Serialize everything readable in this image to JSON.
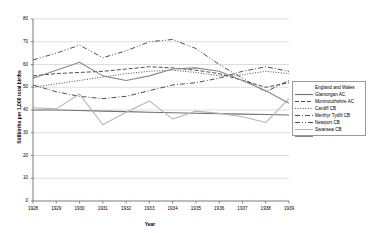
{
  "chart_data": {
    "type": "line",
    "title": "",
    "xlabel": "Year",
    "ylabel": "Stillbirths per 1,000 total births",
    "categories": [
      "1928",
      "1929",
      "1930",
      "1931",
      "1932",
      "1933",
      "1934",
      "1935",
      "1936",
      "1937",
      "1938",
      "1939"
    ],
    "x": [
      1928,
      1929,
      1930,
      1931,
      1932,
      1933,
      1934,
      1935,
      1936,
      1937,
      1938,
      1939
    ],
    "xlim": [
      1928,
      1939
    ],
    "ylim": [
      0,
      80
    ],
    "yticks": [
      0,
      10,
      20,
      30,
      40,
      50,
      60,
      70,
      80
    ],
    "grid": true,
    "legend_position": "right",
    "series": [
      {
        "name": "England and Wales",
        "dash": "solid",
        "color": "#6f6f6f",
        "width": 1.1,
        "values": [
          40,
          40,
          39.8,
          39.5,
          39.3,
          39,
          38.8,
          38.6,
          38.4,
          38.2,
          38,
          37.8
        ]
      },
      {
        "name": "Glamorgan AC",
        "dash": "dashed",
        "color": "#3a3a3a",
        "width": 0.9,
        "values": [
          55,
          56,
          56.5,
          57,
          58,
          59,
          58.5,
          57.5,
          56,
          53,
          50,
          52
        ]
      },
      {
        "name": "Monmouthshire AC",
        "dash": "dotted",
        "color": "#3a3a3a",
        "width": 0.9,
        "values": [
          50,
          51.5,
          53,
          54.5,
          56,
          57,
          57.5,
          56.5,
          55,
          55.5,
          57,
          56
        ]
      },
      {
        "name": "Cardiff CB",
        "dash": "dashdot",
        "color": "#3a3a3a",
        "width": 0.9,
        "values": [
          51,
          48,
          46,
          45,
          46,
          48.5,
          51,
          52,
          54,
          57,
          59,
          57
        ]
      },
      {
        "name": "Merthyr Tydfil CB",
        "dash": "dashdotdot",
        "color": "#3a3a3a",
        "width": 0.9,
        "values": [
          62,
          65,
          68.5,
          63,
          66,
          70,
          71,
          67,
          60,
          54,
          48,
          53
        ]
      },
      {
        "name": "Newport CB",
        "dash": "solid",
        "color": "#b6b6b6",
        "width": 1.1,
        "values": [
          41,
          40.5,
          47,
          33.5,
          39,
          44,
          36,
          39.5,
          38.5,
          37,
          34.5,
          45
        ]
      },
      {
        "name": "Swansea CB",
        "dash": "solid",
        "color": "#888888",
        "width": 1.1,
        "values": [
          54,
          57.5,
          61,
          55,
          53,
          55,
          58,
          58.5,
          57,
          53,
          48.5,
          43
        ]
      }
    ]
  }
}
